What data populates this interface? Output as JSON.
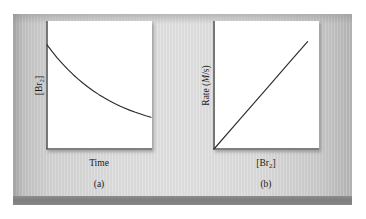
{
  "figure": {
    "background_color": "#ffffff",
    "plate_color": "#dcdcdc",
    "band_color": "#808080",
    "axis_color": "#555555",
    "curve_color": "#2b2b2b"
  },
  "panels": [
    {
      "id": "a",
      "caption": "(a)",
      "ylabel_prefix": "[Br",
      "ylabel_sub": "2",
      "ylabel_suffix": "]",
      "xlabel_prefix": "Time",
      "xlabel_sub": "",
      "xlabel_suffix": ""
    },
    {
      "id": "b",
      "caption": "(b)",
      "ylabel_prefix": "Rate (",
      "ylabel_sub": "",
      "ylabel_italic": "M",
      "ylabel_suffix": "/s)",
      "xlabel_prefix": "[Br",
      "xlabel_sub": "2",
      "xlabel_suffix": "]"
    }
  ],
  "chart_data": [
    {
      "type": "line",
      "id": "panel-a",
      "title": "",
      "xlabel": "Time",
      "ylabel": "[Br2]",
      "caption": "(a)",
      "grid": false,
      "legend": "none",
      "axis_style": "L-shaped (left and bottom spines only)",
      "xlim": [
        0,
        1
      ],
      "ylim": [
        0,
        1
      ],
      "tick_labels_x": [],
      "tick_labels_y": [],
      "description": "Exponential decay of bromine concentration with time",
      "x": [
        0.0,
        0.05,
        0.1,
        0.15,
        0.2,
        0.25,
        0.3,
        0.35,
        0.4,
        0.45,
        0.5,
        0.55,
        0.6,
        0.65,
        0.7,
        0.75,
        0.8,
        0.85,
        0.9,
        0.95,
        1.0
      ],
      "y": [
        0.82,
        0.766,
        0.716,
        0.67,
        0.627,
        0.587,
        0.55,
        0.516,
        0.484,
        0.455,
        0.428,
        0.403,
        0.38,
        0.359,
        0.339,
        0.321,
        0.304,
        0.289,
        0.275,
        0.262,
        0.25
      ]
    },
    {
      "type": "line",
      "id": "panel-b",
      "title": "",
      "xlabel": "[Br2]",
      "ylabel": "Rate (M/s)",
      "caption": "(b)",
      "grid": false,
      "legend": "none",
      "axis_style": "L-shaped (left and bottom spines only)",
      "xlim": [
        0,
        1
      ],
      "ylim": [
        0,
        1
      ],
      "tick_labels_x": [],
      "tick_labels_y": [],
      "description": "Rate is directly proportional to bromine concentration (straight line through origin)",
      "x": [
        0.0,
        0.25,
        0.5,
        0.75,
        0.9
      ],
      "y": [
        0.0,
        0.235,
        0.47,
        0.705,
        0.846
      ]
    }
  ]
}
